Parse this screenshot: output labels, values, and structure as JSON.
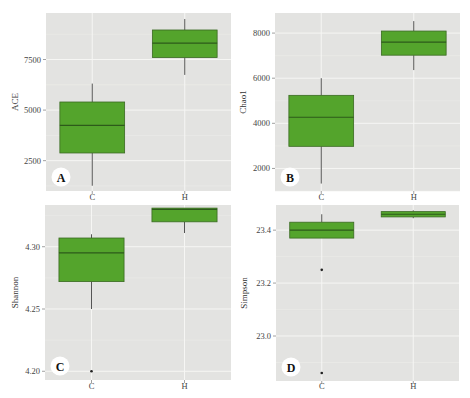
{
  "figure": {
    "colors": {
      "panel_bg": "#e3e3e1",
      "grid_major": "#f6f6f4",
      "grid_minor": "#ececea",
      "box_fill": "#54a42c",
      "box_stroke": "#3a6a22",
      "median": "#2d5a1a",
      "whisker": "#555555",
      "outlier": "#222222",
      "tick_text": "#444444",
      "label_badge_bg": "#ffffff",
      "label_badge_text": "#111111"
    }
  },
  "chart_data": [
    {
      "type": "box",
      "panel_label": "A",
      "title": "",
      "xlabel": "",
      "ylabel": "ACE",
      "categories": [
        "C",
        "H"
      ],
      "yticks": [
        2500,
        5000,
        7500
      ],
      "ytick_labels": [
        "2500",
        "5000",
        "7500"
      ],
      "ylim": [
        1000,
        9800
      ],
      "grid": true,
      "series": [
        {
          "name": "C",
          "min": 1260,
          "q1": 2880,
          "median": 4240,
          "q3": 5400,
          "max": 6310,
          "outliers": []
        },
        {
          "name": "H",
          "min": 6740,
          "q1": 7600,
          "median": 8310,
          "q3": 8960,
          "max": 9500,
          "outliers": []
        }
      ],
      "layout": {
        "x": 46,
        "y": 13,
        "w": 185,
        "h": 178,
        "xlabel_y": 200,
        "show_xlabels": true,
        "ylabel_x": 18
      }
    },
    {
      "type": "box",
      "panel_label": "B",
      "title": "",
      "xlabel": "",
      "ylabel": "Chao1",
      "categories": [
        "C",
        "H"
      ],
      "yticks": [
        2000,
        4000,
        6000,
        8000
      ],
      "ytick_labels": [
        "2000",
        "4000",
        "6000",
        "8000"
      ],
      "ylim": [
        1000,
        8890
      ],
      "grid": true,
      "series": [
        {
          "name": "C",
          "min": 1330,
          "q1": 2980,
          "median": 4270,
          "q3": 5240,
          "max": 6000,
          "outliers": []
        },
        {
          "name": "H",
          "min": 6360,
          "q1": 7020,
          "median": 7600,
          "q3": 8090,
          "max": 8530,
          "outliers": []
        }
      ],
      "layout": {
        "x": 275,
        "y": 13,
        "w": 185,
        "h": 178,
        "xlabel_y": 200,
        "show_xlabels": true,
        "ylabel_x": 246
      }
    },
    {
      "type": "box",
      "panel_label": "C",
      "title": "",
      "xlabel": "",
      "ylabel": "Shannon",
      "categories": [
        "C",
        "H"
      ],
      "yticks": [
        4.2,
        4.25,
        4.3
      ],
      "ytick_labels": [
        "4.20",
        "4.25",
        "4.30"
      ],
      "ylim": [
        4.193,
        4.3335
      ],
      "grid": true,
      "series": [
        {
          "name": "C",
          "min": 4.25,
          "q1": 4.272,
          "median": 4.295,
          "q3": 4.307,
          "max": 4.31,
          "outliers": [
            4.2
          ]
        },
        {
          "name": "H",
          "min": 4.311,
          "q1": 4.32,
          "median": 4.33,
          "q3": 4.331,
          "max": 4.331,
          "outliers": []
        }
      ],
      "layout": {
        "x": 45,
        "y": 205,
        "w": 186,
        "h": 175,
        "xlabel_y": 389,
        "show_xlabels": true,
        "ylabel_x": 18
      }
    },
    {
      "type": "box",
      "panel_label": "D",
      "title": "",
      "xlabel": "",
      "ylabel": "Simpson",
      "categories": [
        "C",
        "H"
      ],
      "yticks": [
        23.0,
        23.2,
        23.4
      ],
      "ytick_labels": [
        "23.0",
        "23.2",
        "23.4"
      ],
      "ylim": [
        22.83,
        23.495
      ],
      "grid": true,
      "series": [
        {
          "name": "C",
          "min": 23.37,
          "q1": 23.37,
          "median": 23.4,
          "q3": 23.43,
          "max": 23.46,
          "outliers": [
            23.25,
            22.86
          ]
        },
        {
          "name": "H",
          "min": 23.445,
          "q1": 23.45,
          "median": 23.46,
          "q3": 23.47,
          "max": 23.475,
          "outliers": []
        }
      ],
      "layout": {
        "x": 276,
        "y": 205,
        "w": 183,
        "h": 176,
        "xlabel_y": 389,
        "show_xlabels": true,
        "ylabel_x": 247
      }
    }
  ]
}
